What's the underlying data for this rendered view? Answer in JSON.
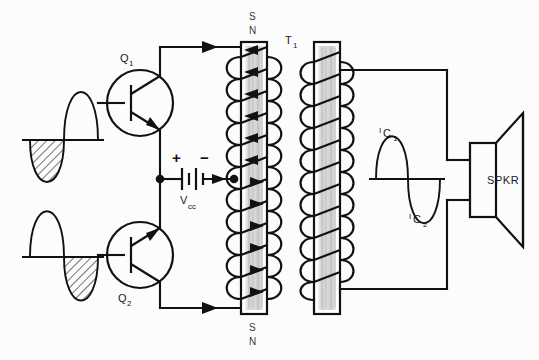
{
  "figure": {
    "type": "schematic-circuit-diagram",
    "background_color": "#fcfcfc",
    "line_color": "#111111",
    "core_color": "#d9d9d9"
  },
  "labels": {
    "q1": "Q",
    "q1_sub": "1",
    "q2": "Q",
    "q2_sub": "2",
    "vcc": "V",
    "vcc_sub": "cc",
    "plus": "+",
    "minus": "−",
    "t1": "T",
    "t1_sub": "1",
    "pole_top_s": "S",
    "pole_top_n": "N",
    "pole_bottom_s": "S",
    "pole_bottom_n": "N",
    "ic1": "I",
    "ic1_sub": "C",
    "ic1_sub2": "1",
    "ic2": "I",
    "ic2_sub": "C",
    "ic2_sub2": "2",
    "speaker": "SPKR"
  },
  "components": [
    {
      "name": "transistor-q1",
      "type": "npn-bipolar-transistor",
      "label": "Q1",
      "position": {
        "cx": 140,
        "cy": 103,
        "r": 33
      },
      "orientation": "collector-up"
    },
    {
      "name": "transistor-q2",
      "type": "npn-bipolar-transistor",
      "label": "Q2",
      "position": {
        "cx": 140,
        "cy": 255,
        "r": 33
      },
      "orientation": "collector-down"
    },
    {
      "name": "battery-vcc",
      "type": "dc-supply-battery",
      "label": "Vcc",
      "polarity_left": "+",
      "polarity_right": "−",
      "position": {
        "x": 175,
        "y": 180
      }
    },
    {
      "name": "transformer-t1",
      "type": "center-tapped-output-transformer",
      "label": "T1",
      "primary": {
        "x": 240,
        "y": 42,
        "w": 26,
        "h": 272,
        "turns": 12
      },
      "secondary": {
        "x": 313,
        "y": 42,
        "w": 26,
        "h": 272,
        "turns": 11
      },
      "center_tap_y": 179
    },
    {
      "name": "loudspeaker",
      "type": "speaker",
      "label": "SPKR",
      "position": {
        "x": 470,
        "y": 143,
        "w": 26,
        "h": 74
      }
    }
  ],
  "waveforms": [
    {
      "name": "input-waveform-q1",
      "position": {
        "x": 22,
        "y": 105,
        "width": 82,
        "height": 70
      },
      "description": "sine input to Q1 base; negative half-cycle hatched",
      "shaded_half": "negative",
      "first_half": "negative",
      "shading": "diagonal-hatch"
    },
    {
      "name": "input-waveform-q2",
      "position": {
        "x": 22,
        "y": 257,
        "width": 82,
        "height": 70
      },
      "description": "sine input to Q2 base; negative half-cycle hatched",
      "shaded_half": "negative",
      "first_half": "positive",
      "shading": "diagonal-hatch"
    },
    {
      "name": "output-waveform-secondary",
      "position": {
        "x": 369,
        "y": 179,
        "width": 76,
        "height": 70
      },
      "description": "recombined full sine on transformer secondary",
      "upper_label": "IC1",
      "lower_label": "IC2",
      "shading": "none"
    }
  ],
  "current_arrows": [
    {
      "name": "arrow-q1-collector-to-primary-top",
      "direction": "right",
      "x": 200,
      "y": 47
    },
    {
      "name": "arrow-q2-collector-to-primary-bottom",
      "direction": "right",
      "x": 200,
      "y": 308
    },
    {
      "name": "arrow-center-tap-to-primary",
      "direction": "right",
      "x": 216,
      "y": 179
    },
    {
      "name": "primary-flux-arrows",
      "direction": "left-into-core",
      "count": 10
    }
  ],
  "nets": [
    {
      "name": "net-input-q1-base",
      "from": "input-waveform-q1",
      "to": "transistor-q1-base"
    },
    {
      "name": "net-input-q2-base",
      "from": "input-waveform-q2",
      "to": "transistor-q2-base"
    },
    {
      "name": "net-q1-collector-primary-top",
      "from": "transistor-q1-collector",
      "to": "primary-winding-top"
    },
    {
      "name": "net-q2-collector-primary-bottom",
      "from": "transistor-q2-collector",
      "to": "primary-winding-bottom"
    },
    {
      "name": "net-emitters-to-vcc",
      "from": "transistor-emitters",
      "to": "battery-vcc-positive"
    },
    {
      "name": "net-vcc-to-center-tap",
      "from": "battery-vcc-negative",
      "to": "primary-center-tap"
    },
    {
      "name": "net-secondary-top-to-speaker",
      "from": "secondary-winding-top",
      "to": "speaker-terminal-top"
    },
    {
      "name": "net-secondary-bottom-to-speaker",
      "from": "secondary-winding-bottom",
      "to": "speaker-terminal-bottom"
    }
  ]
}
